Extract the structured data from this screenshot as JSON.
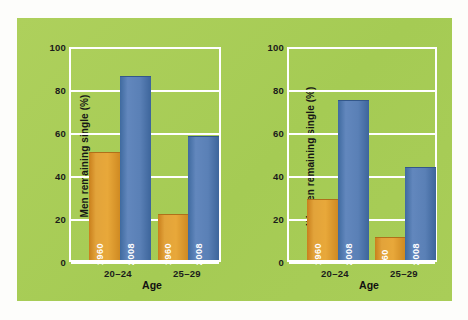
{
  "figure": {
    "background_color": "#ffffff",
    "panel_color": "#a9ce59",
    "orange_color": "#e2a33a",
    "blue_color": "#5a80b6",
    "gridline_color": "#ffffff"
  },
  "chart_data": [
    {
      "type": "bar",
      "title": "",
      "xlabel": "Age",
      "ylabel": "Men remaining single (%)",
      "categories": [
        "20–24",
        "25–29"
      ],
      "ylim": [
        0,
        100
      ],
      "yticks": [
        0,
        20,
        40,
        60,
        80,
        100
      ],
      "ytick_labels": [
        "0",
        "20",
        "40",
        "60",
        "80",
        "100"
      ],
      "grid": true,
      "legend": "none",
      "bar_labels": [
        [
          "1960",
          "2008"
        ],
        [
          "1960",
          "2008"
        ]
      ],
      "series": [
        {
          "name": "1960",
          "color": "#e2a33a",
          "values": [
            51,
            22
          ]
        },
        {
          "name": "2008",
          "color": "#5a80b6",
          "values": [
            87,
            59
          ]
        }
      ]
    },
    {
      "type": "bar",
      "title": "",
      "xlabel": "Age",
      "ylabel": "Women remaining single (%)",
      "categories": [
        "20–24",
        "25–29"
      ],
      "ylim": [
        0,
        100
      ],
      "yticks": [
        0,
        20,
        40,
        60,
        80,
        100
      ],
      "ytick_labels": [
        "0",
        "20",
        "40",
        "60",
        "80",
        "100"
      ],
      "grid": true,
      "legend": "none",
      "bar_labels": [
        [
          "1960",
          "2008"
        ],
        [
          "'60",
          "2008"
        ]
      ],
      "series": [
        {
          "name": "1960",
          "color": "#e2a33a",
          "values": [
            29,
            11
          ]
        },
        {
          "name": "2008",
          "color": "#5a80b6",
          "values": [
            76,
            44
          ]
        }
      ]
    }
  ],
  "men_chart": {
    "ylabel": "Men remaining single (%)",
    "xlabel": "Age",
    "yticks": [
      "100",
      "80",
      "60",
      "40",
      "20",
      "0"
    ],
    "xticks": [
      "20–24",
      "25–29"
    ],
    "bars": [
      {
        "name": "men-20-24-1960",
        "label": "1960",
        "value": 51,
        "series": "1960"
      },
      {
        "name": "men-20-24-2008",
        "label": "2008",
        "value": 87,
        "series": "2008"
      },
      {
        "name": "men-25-29-1960",
        "label": "1960",
        "value": 22,
        "series": "1960"
      },
      {
        "name": "men-25-29-2008",
        "label": "2008",
        "value": 59,
        "series": "2008"
      }
    ]
  },
  "women_chart": {
    "ylabel": "Women remaining single (%)",
    "xlabel": "Age",
    "yticks": [
      "100",
      "80",
      "60",
      "40",
      "20",
      "0"
    ],
    "xticks": [
      "20–24",
      "25–29"
    ],
    "bars": [
      {
        "name": "women-20-24-1960",
        "label": "1960",
        "value": 29,
        "series": "1960"
      },
      {
        "name": "women-20-24-2008",
        "label": "2008",
        "value": 76,
        "series": "2008"
      },
      {
        "name": "women-25-29-1960",
        "label": "'60",
        "value": 11,
        "series": "1960"
      },
      {
        "name": "women-25-29-2008",
        "label": "2008",
        "value": 44,
        "series": "2008"
      }
    ]
  }
}
